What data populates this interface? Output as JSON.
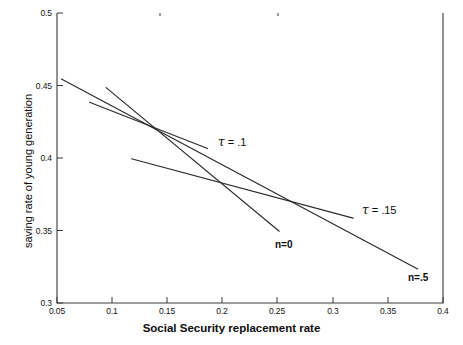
{
  "chart_data": {
    "type": "line",
    "title": "",
    "xlabel": "Social Security replacement rate",
    "ylabel": "saving rate of young generation",
    "xlim": [
      0.05,
      0.4
    ],
    "ylim": [
      0.3,
      0.5
    ],
    "grid": false,
    "legend_position": "inline-annotations",
    "xticks": [
      0.05,
      0.1,
      0.15,
      0.2,
      0.25,
      0.3,
      0.35,
      0.4
    ],
    "xtick_labels": [
      "0.05",
      "0.1",
      "0.15",
      "0.2",
      "0.25",
      "0.3",
      "0.35",
      "0.4"
    ],
    "yticks": [
      0.3,
      0.35,
      0.4,
      0.45,
      0.5
    ],
    "ytick_labels": [
      "0.3",
      "0.35",
      "0.4",
      "0.45",
      "0.5"
    ],
    "series": [
      {
        "name": "n=.5",
        "label": "n=.5",
        "label_position": "end-right-below",
        "x": [
          0.054,
          0.377
        ],
        "y": [
          0.4545,
          0.3235
        ]
      },
      {
        "name": "n=0",
        "label": "n=0",
        "label_position": "end-right-below",
        "x": [
          0.0945,
          0.2515
        ],
        "y": [
          0.4485,
          0.3495
        ]
      },
      {
        "name": "tau = .1",
        "label": "τ = .1",
        "label_position": "end-right",
        "x": [
          0.0795,
          0.1865
        ],
        "y": [
          0.4385,
          0.4065
        ]
      },
      {
        "name": "tau = .15",
        "label": "τ = .15",
        "label_position": "end-right",
        "x": [
          0.1175,
          0.3185
        ],
        "y": [
          0.3995,
          0.3585
        ]
      }
    ],
    "annotations": [
      {
        "text": "τ = .1",
        "x": 0.205,
        "y": 0.412
      },
      {
        "text": "τ = .15",
        "x": 0.333,
        "y": 0.364
      },
      {
        "text": "n=0",
        "x": 0.253,
        "y": 0.339
      },
      {
        "text": "n=.5",
        "x": 0.378,
        "y": 0.313
      }
    ],
    "colors": {
      "line": "#2a2a2a",
      "axis": "#3a3a3a",
      "text": "#111111",
      "background": "#ffffff"
    }
  },
  "axis_labels": {
    "x_title": "Social Security replacement rate",
    "y_title": "saving rate of young generation"
  },
  "ticks": {
    "x": [
      "0.05",
      "0.1",
      "0.15",
      "0.2",
      "0.25",
      "0.3",
      "0.35",
      "0.4"
    ],
    "y": [
      "0.5",
      "0.45",
      "0.4",
      "0.35",
      "0.3"
    ]
  },
  "series_labels": {
    "tau_point_one": "τ = .1",
    "tau_point_one_five": "τ = .15",
    "n_zero": "n=0",
    "n_point_five": "n=.5"
  },
  "tau_parts": {
    "symbol": "τ",
    "eq_one": "= .1",
    "eq_one_five": "= .15"
  }
}
